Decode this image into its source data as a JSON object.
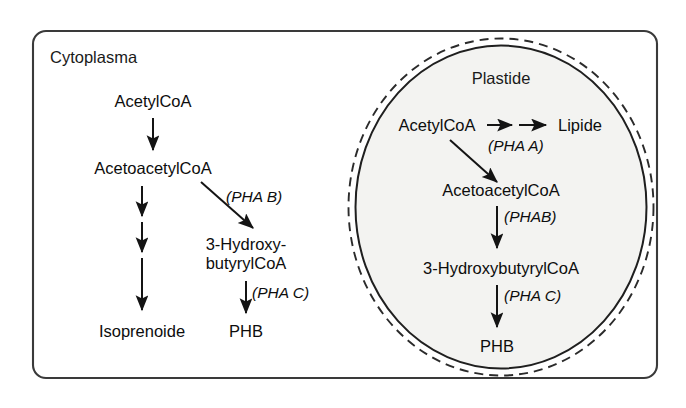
{
  "figure": {
    "type": "biochemical-pathway-diagram",
    "background_color": "#ffffff",
    "line_color": "#141414",
    "plastid_fill_color": "#f3f3f1"
  },
  "compartments": {
    "cytoplasm": {
      "label": "Cytoplasma",
      "shape": "rounded-rectangle"
    },
    "plastid": {
      "label": "Plastide",
      "shape": "double-membrane-ellipse",
      "membrane_outer_style": "dashed",
      "membrane_inner_style": "solid"
    }
  },
  "cytoplasm_pathway": {
    "metabolites": [
      {
        "id": "acetylcoa",
        "label": "AcetylCoA"
      },
      {
        "id": "acetoacetylcoa",
        "label": "AcetoacetylCoA"
      },
      {
        "id": "hydroxybutyrylcoa_line1",
        "label": "3-Hydroxy-"
      },
      {
        "id": "hydroxybutyrylcoa_line2",
        "label": "butyrylCoA"
      },
      {
        "id": "isoprenoide",
        "label": "Isoprenoide"
      },
      {
        "id": "phb",
        "label": "PHB"
      }
    ],
    "enzymes": [
      {
        "id": "pha_b",
        "label": "(PHA B)"
      },
      {
        "id": "pha_c",
        "label": "(PHA C)"
      }
    ],
    "steps": [
      {
        "from": "AcetylCoA",
        "to": "AcetoacetylCoA",
        "enzyme": "",
        "arrows": 1
      },
      {
        "from": "AcetoacetylCoA",
        "to": "Isoprenoide",
        "enzyme": "",
        "arrows": 3
      },
      {
        "from": "AcetoacetylCoA",
        "to": "3-Hydroxy-butyrylCoA",
        "enzyme": "(PHA B)",
        "arrows": 1
      },
      {
        "from": "3-Hydroxy-butyrylCoA",
        "to": "PHB",
        "enzyme": "(PHA C)",
        "arrows": 1
      }
    ]
  },
  "plastid_pathway": {
    "metabolites": [
      {
        "id": "p_acetylcoa",
        "label": "AcetylCoA"
      },
      {
        "id": "p_lipide",
        "label": "Lipide"
      },
      {
        "id": "p_acetoacetylcoa",
        "label": "AcetoacetylCoA"
      },
      {
        "id": "p_hydroxybutyrylcoa",
        "label": "3-HydroxybutyrylCoA"
      },
      {
        "id": "p_phb",
        "label": "PHB"
      }
    ],
    "enzymes": [
      {
        "id": "p_pha_a",
        "label": "(PHA A)"
      },
      {
        "id": "p_pha_b",
        "label": "(PHAB)"
      },
      {
        "id": "p_pha_c",
        "label": "(PHA C)"
      }
    ],
    "steps": [
      {
        "from": "AcetylCoA",
        "to": "Lipide",
        "enzyme": "",
        "arrows": 2
      },
      {
        "from": "AcetylCoA",
        "to": "AcetoacetylCoA",
        "enzyme": "(PHA A)",
        "arrows": 1
      },
      {
        "from": "AcetoacetylCoA",
        "to": "3-HydroxybutyrylCoA",
        "enzyme": "(PHAB)",
        "arrows": 1
      },
      {
        "from": "3-HydroxybutyrylCoA",
        "to": "PHB",
        "enzyme": "(PHA C)",
        "arrows": 1
      }
    ]
  }
}
